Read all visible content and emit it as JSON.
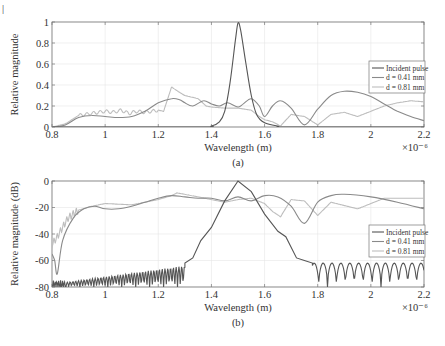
{
  "page_mark": "|",
  "chart_data": [
    {
      "type": "line",
      "id": "a",
      "caption": "(a)",
      "xlabel": "Wavelength (m)",
      "ylabel": "Relative magnitude",
      "xlim": [
        0.8,
        2.2
      ],
      "ylim": [
        0,
        1
      ],
      "x_exponent_label": "×10⁻⁶",
      "xticks": [
        0.8,
        1,
        1.2,
        1.4,
        1.6,
        1.8,
        2,
        2.2
      ],
      "xtick_labels": [
        "0.8",
        "1",
        "1.2",
        "1.4",
        "1.6",
        "1.8",
        "2",
        "2.2"
      ],
      "yticks": [
        0,
        0.2,
        0.4,
        0.6,
        0.8,
        1
      ],
      "ytick_labels": [
        "0",
        "0.2",
        "0.4",
        "0.6",
        "0.8",
        "1"
      ],
      "grid": true,
      "legend_position": "right",
      "series": [
        {
          "name": "Incident pulse",
          "legend_label": "Incident pulse",
          "color": "#555555",
          "x": [
            0.8,
            1.35,
            1.4,
            1.43,
            1.45,
            1.47,
            1.49,
            1.5,
            1.51,
            1.53,
            1.55,
            1.57,
            1.6,
            1.65,
            1.7,
            2.2
          ],
          "y": [
            0,
            0,
            0.01,
            0.05,
            0.15,
            0.42,
            0.82,
            0.99,
            0.92,
            0.6,
            0.3,
            0.12,
            0.04,
            0.01,
            0,
            0
          ]
        },
        {
          "name": "d = 0.41 mm",
          "legend_label": "d = 0.41 mm",
          "color": "#8a8a8a",
          "x": [
            0.8,
            0.85,
            0.9,
            0.95,
            1.0,
            1.05,
            1.1,
            1.15,
            1.2,
            1.25,
            1.28,
            1.3,
            1.33,
            1.37,
            1.4,
            1.43,
            1.46,
            1.5,
            1.52,
            1.55,
            1.58,
            1.6,
            1.63,
            1.66,
            1.7,
            1.75,
            1.8,
            1.85,
            1.9,
            1.95,
            2.0,
            2.05,
            2.1,
            2.15,
            2.2
          ],
          "y": [
            0,
            0.02,
            0.09,
            0.11,
            0.1,
            0.09,
            0.1,
            0.15,
            0.23,
            0.27,
            0.26,
            0.23,
            0.2,
            0.25,
            0.22,
            0.2,
            0.23,
            0.19,
            0.22,
            0.27,
            0.2,
            0.1,
            0.2,
            0.25,
            0.18,
            0.02,
            0.17,
            0.3,
            0.34,
            0.33,
            0.29,
            0.22,
            0.15,
            0.1,
            0.06
          ]
        },
        {
          "name": "d = 0.81 mm",
          "legend_label": "d = 0.81 mm",
          "color": "#bdbdbd",
          "x": [
            0.8,
            0.85,
            0.9,
            0.95,
            1.0,
            1.03,
            1.06,
            1.09,
            1.12,
            1.15,
            1.2,
            1.22,
            1.25,
            1.28,
            1.3,
            1.35,
            1.38,
            1.4,
            1.45,
            1.5,
            1.55,
            1.58,
            1.6,
            1.63,
            1.66,
            1.7,
            1.75,
            1.8,
            1.85,
            1.9,
            1.95,
            2.0,
            2.05,
            2.1,
            2.15,
            2.2
          ],
          "y": [
            0,
            0.03,
            0.11,
            0.13,
            0.15,
            0.14,
            0.16,
            0.13,
            0.15,
            0.14,
            0.16,
            0.15,
            0.38,
            0.33,
            0.3,
            0.27,
            0.2,
            0.19,
            0.18,
            0.18,
            0.16,
            0.1,
            0.07,
            0.05,
            0.01,
            0.12,
            0.1,
            0.02,
            0.12,
            0.14,
            0.1,
            0.15,
            0.2,
            0.23,
            0.25,
            0.24
          ]
        }
      ]
    },
    {
      "type": "line",
      "id": "b",
      "caption": "(b)",
      "xlabel": "Wavelength (m)",
      "ylabel": "Relative magnitude (dB)",
      "xlim": [
        0.8,
        2.2
      ],
      "ylim": [
        -80,
        0
      ],
      "x_exponent_label": "×10⁻⁶",
      "xticks": [
        0.8,
        1,
        1.2,
        1.4,
        1.6,
        1.8,
        2,
        2.2
      ],
      "xtick_labels": [
        "0.8",
        "1",
        "1.2",
        "1.4",
        "1.6",
        "1.8",
        "2",
        "2.2"
      ],
      "yticks": [
        -80,
        -60,
        -40,
        -20,
        0
      ],
      "ytick_labels": [
        "-80",
        "-60",
        "-40",
        "-20",
        "0"
      ],
      "grid": true,
      "legend_position": "right",
      "series": [
        {
          "name": "Incident pulse",
          "legend_label": "Incident pulse",
          "color": "#555555",
          "description": "Oscillating noise floor near -75 dB from 0.8 to 1.3 µm with lobes rising to about -60 dB, steep rise to 0 dB peak at 1.5 µm, decay to about -48 dB at 1.72 µm then periodic sidelobes between -80 and -60 dB out to 2.2 µm",
          "x": [
            0.8,
            1.3,
            1.33,
            1.36,
            1.4,
            1.45,
            1.5,
            1.55,
            1.6,
            1.65,
            1.68,
            1.72,
            1.75,
            1.78
          ],
          "y": [
            -76,
            -62,
            -58,
            -45,
            -35,
            -15,
            0,
            -8,
            -25,
            -38,
            -42,
            -58,
            -60,
            -62
          ]
        },
        {
          "name": "d = 0.41 mm",
          "legend_label": "d = 0.41 mm",
          "color": "#8a8a8a",
          "x": [
            0.8,
            0.81,
            0.82,
            0.84,
            0.88,
            0.92,
            0.96,
            1.0,
            1.05,
            1.1,
            1.15,
            1.2,
            1.25,
            1.3,
            1.35,
            1.4,
            1.45,
            1.5,
            1.55,
            1.6,
            1.65,
            1.7,
            1.75,
            1.8,
            1.85,
            1.9,
            2.0,
            2.1,
            2.2
          ],
          "y": [
            -55,
            -60,
            -70,
            -45,
            -28,
            -21,
            -19,
            -21,
            -21,
            -19,
            -16,
            -13,
            -11,
            -12,
            -13,
            -13,
            -15,
            -12,
            -15,
            -11,
            -12,
            -19,
            -32,
            -16,
            -11,
            -10,
            -12,
            -16,
            -21
          ]
        },
        {
          "name": "d = 0.81 mm",
          "legend_label": "d = 0.81 mm",
          "color": "#bdbdbd",
          "x": [
            0.8,
            0.82,
            0.84,
            0.86,
            0.9,
            0.95,
            1.0,
            1.1,
            1.2,
            1.25,
            1.27,
            1.3,
            1.35,
            1.4,
            1.45,
            1.5,
            1.55,
            1.6,
            1.63,
            1.66,
            1.7,
            1.75,
            1.8,
            1.85,
            1.95,
            2.05,
            2.1,
            2.2
          ],
          "y": [
            -48,
            -42,
            -35,
            -28,
            -22,
            -19,
            -17,
            -18,
            -14,
            -11,
            -9,
            -10,
            -12,
            -14,
            -16,
            -14,
            -13,
            -17,
            -23,
            -27,
            -14,
            -15,
            -26,
            -16,
            -21,
            -13,
            -13,
            -13
          ]
        }
      ]
    }
  ]
}
